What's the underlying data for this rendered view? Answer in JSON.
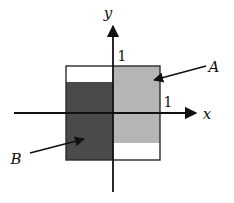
{
  "figure": {
    "background_color": "#ffffff",
    "stroke_color": "#111111"
  },
  "axes": {
    "x_label": "x",
    "y_label": "y",
    "x_tick_label": "1",
    "y_tick_label": "1",
    "origin_px": {
      "x": 113,
      "y": 113
    },
    "unit_px": 47,
    "x_axis_from_px": {
      "x": 14,
      "y": 113
    },
    "x_axis_to_px": {
      "x": 200,
      "y": 113
    },
    "y_axis_from_px": {
      "x": 113,
      "y": 192
    },
    "y_axis_to_px": {
      "x": 113,
      "y": 22
    }
  },
  "colors": {
    "region_a_fill": "#b5b5b5",
    "region_b_fill": "#4a4a4a",
    "unshaded_fill": "#ffffff",
    "outline": "#2b2b2b",
    "axis": "#111111",
    "text": "#111111"
  },
  "bounding_box": {
    "label": "outer-square",
    "x_min": -1.0,
    "x_max": 1.0,
    "y_min": -1.0,
    "y_max": 1.0,
    "px": {
      "left": 66,
      "top": 66,
      "right": 160,
      "bottom": 160
    }
  },
  "regions": [
    {
      "id": "A",
      "label": "A",
      "fill": "#b5b5b5",
      "description": "right half, upper portion",
      "x_min": 0.0,
      "x_max": 1.0,
      "y_min": -0.64,
      "y_max": 1.0,
      "px": {
        "left": 113,
        "top": 66,
        "right": 160,
        "bottom": 143
      }
    },
    {
      "id": "B",
      "label": "B",
      "fill": "#4a4a4a",
      "description": "left half, lower portion",
      "x_min": -1.0,
      "x_max": 0.0,
      "y_min": -1.0,
      "y_max": 0.66,
      "px": {
        "left": 66,
        "top": 82,
        "right": 113,
        "bottom": 160
      }
    }
  ],
  "callouts": [
    {
      "id": "callout-a",
      "label": "A",
      "label_px": {
        "x": 214,
        "y": 72
      },
      "arrow_from_px": {
        "x": 206,
        "y": 66
      },
      "arrow_to_px": {
        "x": 152,
        "y": 81
      }
    },
    {
      "id": "callout-b",
      "label": "B",
      "label_px": {
        "x": 14,
        "y": 163
      },
      "arrow_from_px": {
        "x": 30,
        "y": 153
      },
      "arrow_to_px": {
        "x": 86,
        "y": 138
      }
    }
  ],
  "tick_positions": {
    "y_one_px": {
      "x": 118,
      "y": 56
    },
    "x_one_px": {
      "x": 164,
      "y": 103
    }
  }
}
